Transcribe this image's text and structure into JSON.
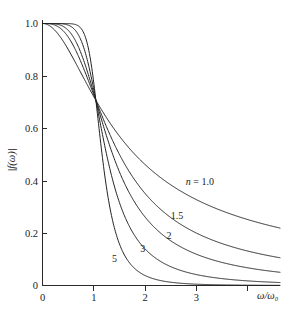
{
  "chart_data": {
    "type": "line",
    "title": "",
    "subtitle": "",
    "xlabel": "ω/ω₀",
    "ylabel": "|f(ω)|",
    "xlim": [
      0,
      4.45
    ],
    "ylim": [
      0,
      1.06
    ],
    "grid": false,
    "legend_position": "inline-annotations",
    "function": "|f(ω)| = 1/sqrt(1 + (ω/ω₀)^(2n))",
    "xticks": [
      {
        "value": 0,
        "label": "0"
      },
      {
        "value": 1,
        "label": "1"
      },
      {
        "value": 2,
        "label": "2"
      },
      {
        "value": 3,
        "label": "3"
      }
    ],
    "yticks": [
      {
        "value": 0,
        "label": "0"
      },
      {
        "value": 0.2,
        "label": "0.2"
      },
      {
        "value": 0.4,
        "label": "0.4"
      },
      {
        "value": 0.6,
        "label": "0.6"
      },
      {
        "value": 0.8,
        "label": "0.8"
      },
      {
        "value": 1.0,
        "label": "1.0"
      }
    ],
    "curve_color": "#232323",
    "series": [
      {
        "name": "n = 1.0",
        "n": 1.0,
        "label": "n = 1.0",
        "label_prefix_italic": "n",
        "label_rest": " = 1.0",
        "label_at": {
          "x": 2.95,
          "y": 0.385
        },
        "x": [
          0,
          0.1,
          0.2,
          0.3,
          0.4,
          0.5,
          0.6,
          0.7,
          0.8,
          0.9,
          1.0,
          1.1,
          1.2,
          1.3,
          1.4,
          1.5,
          1.6,
          1.8,
          2.0,
          2.2,
          2.4,
          2.6,
          2.8,
          3.0,
          3.2,
          3.4,
          3.6,
          3.8,
          4.0,
          4.2,
          4.45
        ],
        "y": [
          1.0,
          0.995,
          0.981,
          0.958,
          0.928,
          0.894,
          0.857,
          0.819,
          0.781,
          0.743,
          0.707,
          0.673,
          0.64,
          0.61,
          0.581,
          0.555,
          0.53,
          0.486,
          0.447,
          0.414,
          0.385,
          0.359,
          0.336,
          0.316,
          0.298,
          0.282,
          0.268,
          0.255,
          0.243,
          0.232,
          0.219
        ]
      },
      {
        "name": "1.5",
        "n": 1.5,
        "label": "1.5",
        "label_at": {
          "x": 2.52,
          "y": 0.255
        },
        "x": [
          0,
          0.1,
          0.2,
          0.3,
          0.4,
          0.5,
          0.6,
          0.7,
          0.8,
          0.9,
          1.0,
          1.1,
          1.2,
          1.3,
          1.4,
          1.5,
          1.6,
          1.8,
          2.0,
          2.2,
          2.4,
          2.6,
          2.8,
          3.0,
          3.2,
          3.4,
          3.6,
          3.8,
          4.0,
          4.2,
          4.45
        ],
        "y": [
          1.0,
          0.9998,
          0.9955,
          0.9918,
          0.9842,
          0.9692,
          0.9456,
          0.9128,
          0.8719,
          0.8243,
          0.707,
          0.6648,
          0.6026,
          0.5436,
          0.4896,
          0.4413,
          0.3985,
          0.3274,
          0.2722,
          0.2291,
          0.1951,
          0.1679,
          0.146,
          0.128,
          0.1131,
          0.1006,
          0.09,
          0.0809,
          0.0731,
          0.0663,
          0.0592
        ]
      },
      {
        "name": "2",
        "n": 2.0,
        "label": "2",
        "label_at": {
          "x": 2.37,
          "y": 0.178
        },
        "x": [
          0,
          0.1,
          0.2,
          0.3,
          0.4,
          0.5,
          0.6,
          0.7,
          0.8,
          0.9,
          1.0,
          1.1,
          1.2,
          1.3,
          1.4,
          1.5,
          1.6,
          1.8,
          2.0,
          2.2,
          2.4,
          2.6,
          2.8,
          3.0,
          3.2,
          3.4,
          3.6,
          3.8,
          4.0,
          4.2,
          4.45
        ],
        "y": [
          1.0,
          1.0,
          0.9992,
          0.996,
          0.9873,
          0.9701,
          0.9412,
          0.8985,
          0.8418,
          0.7739,
          0.707,
          0.6013,
          0.5209,
          0.4504,
          0.3894,
          0.3369,
          0.2923,
          0.223,
          0.1741,
          0.1389,
          0.1128,
          0.0929,
          0.0776,
          0.0656,
          0.056,
          0.0482,
          0.0418,
          0.0365,
          0.0321,
          0.0284,
          0.0244
        ]
      },
      {
        "name": "3",
        "n": 3.0,
        "label": "3",
        "label_at": {
          "x": 1.88,
          "y": 0.128
        },
        "x": [
          0,
          0.1,
          0.2,
          0.3,
          0.4,
          0.5,
          0.6,
          0.7,
          0.8,
          0.9,
          1.0,
          1.1,
          1.2,
          1.3,
          1.4,
          1.5,
          1.6,
          1.8,
          2.0,
          2.2,
          2.4,
          2.6,
          2.8,
          3.0,
          3.2,
          3.4,
          3.6,
          3.8,
          4.0,
          4.2,
          4.45
        ],
        "y": [
          1.0,
          1.0,
          1.0,
          0.9997,
          0.9979,
          0.9922,
          0.9769,
          0.9438,
          0.8845,
          0.7952,
          0.707,
          0.5196,
          0.4027,
          0.3125,
          0.2444,
          0.1934,
          0.1551,
          0.1046,
          0.0745,
          0.0556,
          0.0429,
          0.0339,
          0.0274,
          0.0226,
          0.0189,
          0.016,
          0.0137,
          0.0118,
          0.0103,
          0.009,
          0.0076
        ]
      },
      {
        "name": "5",
        "n": 5.0,
        "label": "5",
        "label_at": {
          "x": 1.35,
          "y": 0.09
        },
        "x": [
          0,
          0.1,
          0.2,
          0.3,
          0.4,
          0.5,
          0.6,
          0.7,
          0.8,
          0.9,
          1.0,
          1.1,
          1.2,
          1.3,
          1.4,
          1.5,
          1.6,
          1.8,
          2.0,
          2.2,
          2.4,
          2.6,
          2.8,
          3.0,
          3.2,
          3.4,
          3.6,
          3.8,
          4.0,
          4.2,
          4.45
        ],
        "y": [
          1.0,
          1.0,
          1.0,
          1.0,
          1.0,
          0.9995,
          0.997,
          0.9862,
          0.9513,
          0.8545,
          0.707,
          0.3845,
          0.2329,
          0.1459,
          0.0944,
          0.0633,
          0.0437,
          0.0225,
          0.0126,
          0.0075,
          0.0047,
          0.0031,
          0.0021,
          0.0014,
          0.001,
          0.0007,
          0.0005,
          0.0004,
          0.0003,
          0.0002,
          0.0002
        ]
      }
    ]
  },
  "axes": {
    "x_axis_label": "ω/ω₀",
    "y_axis_label": "|f(ω)|"
  }
}
